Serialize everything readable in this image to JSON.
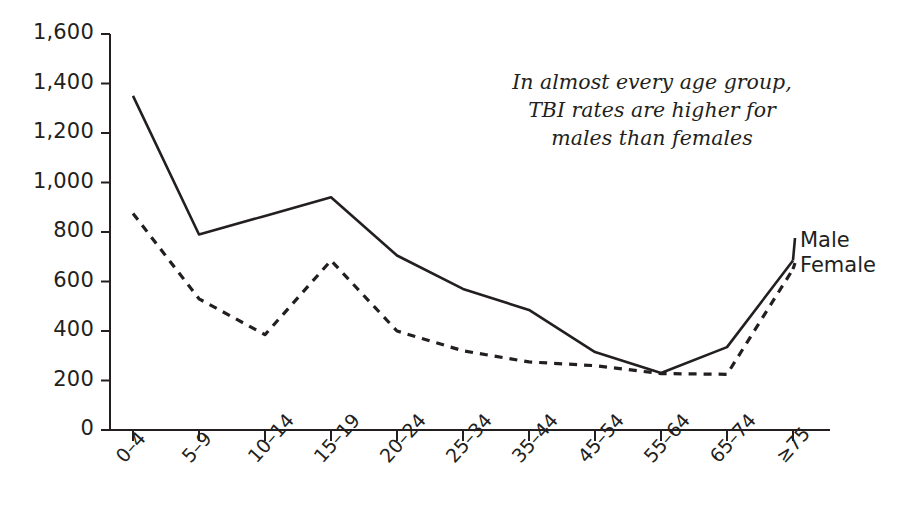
{
  "annotation": {
    "line1": "In almost every age group,",
    "line2": "TBI rates are higher for",
    "line3": "males than females"
  },
  "legend": {
    "male_label": "Male",
    "female_label": "Female"
  },
  "chart_data": {
    "type": "line",
    "title": "",
    "xlabel": "",
    "ylabel": "",
    "ylim": [
      0,
      1600
    ],
    "ytick_labels": [
      "1,600",
      "1,400",
      "1,200",
      "1,000",
      "800",
      "600",
      "400",
      "200",
      "0"
    ],
    "ytick_values": [
      1600,
      1400,
      1200,
      1000,
      800,
      600,
      400,
      200,
      0
    ],
    "grid": false,
    "legend_position": "right-inline",
    "categories": [
      "0–4",
      "5–9",
      "10–14",
      "15–19",
      "20–24",
      "25–34",
      "35–44",
      "45–54",
      "55–64",
      "65–74",
      "≥75"
    ],
    "series": [
      {
        "name": "Male",
        "style": "solid",
        "color": "#231f20",
        "values": [
          1350,
          790,
          865,
          940,
          705,
          570,
          485,
          315,
          230,
          335,
          685
        ]
      },
      {
        "name": "Female",
        "style": "dashed",
        "color": "#231f20",
        "values": [
          875,
          530,
          385,
          685,
          400,
          320,
          275,
          260,
          228,
          225,
          650
        ]
      }
    ],
    "annotations": [
      "In almost every age group, TBI rates are higher for males than females"
    ]
  }
}
